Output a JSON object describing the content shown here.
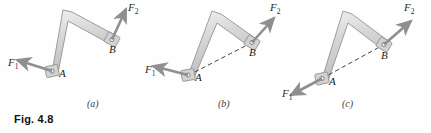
{
  "figure": {
    "caption": "Fig. 4.8",
    "background": "#fefefe",
    "bar_fill": "#d9d9d9",
    "bar_stroke": "#8a8a8a",
    "arrow_color": "#8c8c8c",
    "dash_color": "#3a3a3a",
    "label_color": "#1a1a1a"
  },
  "panels": [
    {
      "id": "a",
      "label": "(a)",
      "label_x": 88,
      "label_y": 103,
      "joint_a": {
        "label": "A",
        "x": 52,
        "y": 72,
        "label_x": 58,
        "label_y": 74
      },
      "joint_b": {
        "label": "B",
        "x": 112,
        "y": 40,
        "label_x": 110,
        "label_y": 46
      },
      "elbow": {
        "x": 67,
        "y": 16
      },
      "force1": {
        "name": "F",
        "subscript": "1",
        "label_x": 11,
        "label_y": 62,
        "tail_x": 52,
        "tail_y": 72,
        "tip_x": 16,
        "tip_y": 60,
        "direction": "left-slightly-up"
      },
      "force2": {
        "name": "F",
        "subscript": "2",
        "label_x": 130,
        "label_y": 4,
        "tail_x": 112,
        "tail_y": 40,
        "tip_x": 126,
        "tip_y": 8,
        "direction": "up-slightly-right"
      },
      "dashed_line": false
    },
    {
      "id": "b",
      "label": "(b)",
      "label_x": 219,
      "label_y": 103,
      "joint_a": {
        "label": "A",
        "x": 188,
        "y": 76,
        "label_x": 194,
        "label_y": 78
      },
      "joint_b": {
        "label": "B",
        "x": 252,
        "y": 43,
        "label_x": 250,
        "label_y": 49
      },
      "elbow": {
        "x": 216,
        "y": 17
      },
      "force1": {
        "name": "F",
        "subscript": "1",
        "label_x": 148,
        "label_y": 68,
        "tail_x": 188,
        "tail_y": 76,
        "tip_x": 152,
        "tip_y": 66,
        "direction": "left-slightly-up"
      },
      "force2": {
        "name": "F",
        "subscript": "2",
        "label_x": 271,
        "label_y": 4,
        "tail_x": 252,
        "tail_y": 43,
        "tip_x": 272,
        "tip_y": 17,
        "direction": "up-right"
      },
      "dashed_line": true
    },
    {
      "id": "c",
      "label": "(c)",
      "label_x": 343,
      "label_y": 103,
      "joint_a": {
        "label": "A",
        "x": 322,
        "y": 79,
        "label_x": 328,
        "label_y": 82
      },
      "joint_b": {
        "label": "B",
        "x": 384,
        "y": 45,
        "label_x": 382,
        "label_y": 52
      },
      "elbow": {
        "x": 347,
        "y": 17
      },
      "force1": {
        "name": "F",
        "subscript": "1",
        "label_x": 285,
        "label_y": 92,
        "tail_x": 322,
        "tail_y": 79,
        "tip_x": 290,
        "tip_y": 96,
        "direction": "down-left-along-AB"
      },
      "force2": {
        "name": "F",
        "subscript": "2",
        "label_x": 405,
        "label_y": 4,
        "tail_x": 384,
        "tail_y": 45,
        "tip_x": 410,
        "tip_y": 20,
        "direction": "up-right"
      },
      "dashed_line": true
    }
  ]
}
